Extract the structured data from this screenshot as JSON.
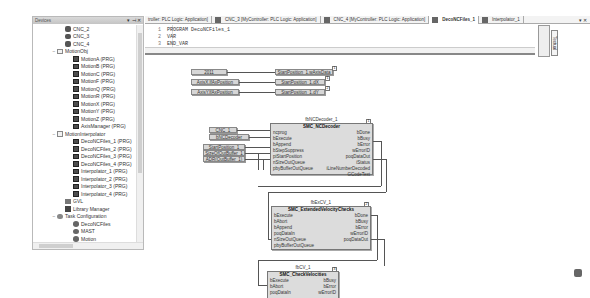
{
  "devices": {
    "title": "Devices",
    "controls": [
      "▾",
      "⊣",
      "✕"
    ],
    "items": [
      {
        "label": "CNC_2",
        "icon": "cnc",
        "indent": 2
      },
      {
        "label": "CNC_3",
        "icon": "cnc",
        "indent": 2
      },
      {
        "label": "CNC_4",
        "icon": "cnc",
        "indent": 2
      },
      {
        "label": "MotionObj",
        "icon": "folder",
        "indent": 1,
        "expander": "−"
      },
      {
        "label": "MotionA (PRG)",
        "icon": "prg",
        "indent": 3
      },
      {
        "label": "MotionB (PRG)",
        "icon": "prg",
        "indent": 3
      },
      {
        "label": "MotionC (PRG)",
        "icon": "prg",
        "indent": 3
      },
      {
        "label": "MotionF (PRG)",
        "icon": "prg",
        "indent": 3
      },
      {
        "label": "MotionQ (PRG)",
        "icon": "prg",
        "indent": 3
      },
      {
        "label": "MotionR (PRG)",
        "icon": "prg",
        "indent": 3
      },
      {
        "label": "MotionX (PRG)",
        "icon": "prg",
        "indent": 3
      },
      {
        "label": "MotionY (PRG)",
        "icon": "prg",
        "indent": 3
      },
      {
        "label": "MotionZ (PRG)",
        "icon": "prg",
        "indent": 3
      },
      {
        "label": "AxisManager (PRG)",
        "icon": "prg",
        "indent": 3
      },
      {
        "label": "MotionInterpolator",
        "icon": "folder",
        "indent": 1,
        "expander": "−"
      },
      {
        "label": "DecoNCFiles_1 (PRG)",
        "icon": "prg",
        "indent": 3
      },
      {
        "label": "DecoNCFiles_2 (PRG)",
        "icon": "prg",
        "indent": 3
      },
      {
        "label": "DecoNCFiles_3 (PRG)",
        "icon": "prg",
        "indent": 3
      },
      {
        "label": "DecoNCFiles_4 (PRG)",
        "icon": "prg",
        "indent": 3
      },
      {
        "label": "Interpolator_1 (PRG)",
        "icon": "prg",
        "indent": 3
      },
      {
        "label": "Interpolator_2 (PRG)",
        "icon": "prg",
        "indent": 3
      },
      {
        "label": "Interpolator_3 (PRG)",
        "icon": "prg",
        "indent": 3
      },
      {
        "label": "Interpolator_4 (PRG)",
        "icon": "prg",
        "indent": 3
      },
      {
        "label": "GVL",
        "icon": "gvl",
        "indent": 2
      },
      {
        "label": "Library Manager",
        "icon": "lib",
        "indent": 2
      },
      {
        "label": "Task Configuration",
        "icon": "task",
        "indent": 1,
        "expander": "−"
      },
      {
        "label": "DecoNCFiles",
        "icon": "gear",
        "indent": 3
      },
      {
        "label": "MAST",
        "icon": "gear",
        "indent": 3
      },
      {
        "label": "Motion",
        "icon": "gear",
        "indent": 3
      },
      {
        "label": "Trace",
        "icon": "trace",
        "indent": 2
      },
      {
        "label": "Visualization Manager",
        "icon": "vis",
        "indent": 2
      },
      {
        "label": "Visualization",
        "icon": "vis",
        "indent": 2
      },
      {
        "label": "Expert",
        "icon": "expert",
        "indent": 0,
        "expander": "+"
      },
      {
        "label": "SoundPlatePlumber (3CN4)",
        "icon": "expert",
        "indent": 1
      }
    ]
  },
  "tabs": [
    {
      "label": "troller: PLC Logic: Application]",
      "active": false
    },
    {
      "label": "CNC_3 [MyController: PLC Logic: Application]",
      "active": false
    },
    {
      "label": "CNC_4 [MyController: PLC Logic: Application]",
      "active": false
    },
    {
      "label": "DecoNCFiles_1",
      "active": true
    },
    {
      "label": "Interpolator_1",
      "active": false
    }
  ],
  "tab_controls": "▾ ✕",
  "declaration": {
    "lines": [
      {
        "n": "1",
        "text": "PROGRAM DecoNCFiles_1"
      },
      {
        "n": "2",
        "text": "VAR"
      },
      {
        "n": "3",
        "text": "END_VAR"
      }
    ]
  },
  "side_toggle": "Textual",
  "diagram": {
    "inputs": [
      {
        "label": "2011",
        "target": "StartPosition_1.wAxisData",
        "num": "1"
      },
      {
        "label": "AxisX.lfAxPosition",
        "target": "StartPosition_1.dX",
        "num": "1"
      },
      {
        "label": "AxisY.lfAxPosition",
        "target": "StartPosition_1.dY",
        "num": "2"
      }
    ],
    "decoder_inputs": [
      {
        "label": "CNC_1"
      },
      {
        "label": "bNCDecoder"
      },
      {
        "label": "StartPosition_1"
      },
      {
        "label": "SizeOfOutBuffer_1"
      },
      {
        "label": "ADR(OutBuffer_1)"
      }
    ],
    "blocks": [
      {
        "instance": "fbNCDecoder_1",
        "type": "SMC_NCDecoder",
        "num": "1",
        "inputs": [
          "ncprog",
          "bExecute",
          "bAppend",
          "bStepSuppress",
          "piStartPosition",
          "nSizeOutQueue",
          "pbyBufferOutQueue"
        ],
        "outputs": [
          "bDone",
          "bBusy",
          "bError",
          "wErrorID",
          "poqDataOut",
          "iStatus",
          "iLineNumberDecoded",
          "GCodeText"
        ]
      },
      {
        "instance": "fbExCV_1",
        "type": "SMC_ExtendedVelocityChecks",
        "num": "2",
        "inputs": [
          "bExecute",
          "bAbort",
          "bAppend",
          "poqDataIn",
          "nSizeOutQueue",
          "pbyBufferOutQueue"
        ],
        "outputs": [
          "bDone",
          "bBusy",
          "bError",
          "wErrorID",
          "poqDataOut"
        ]
      },
      {
        "instance": "fbCV_1",
        "type": "SMC_CheckVelocities",
        "num": "3",
        "inputs": [
          "bExecute",
          "bAbort",
          "poqDataIn"
        ],
        "outputs": [
          "bBusy",
          "bError",
          "wErrorID"
        ]
      }
    ]
  }
}
